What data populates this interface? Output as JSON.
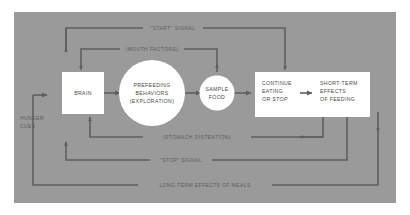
{
  "diagram": {
    "background_color": "#9a9a9a",
    "page_color": "#ffffff",
    "node_fill": "#ffffff",
    "line_color": "#5f5f5f",
    "text_color": "#4a4a4a",
    "nodes": [
      {
        "id": "brain",
        "shape": "rect",
        "lines": [
          "BRAIN"
        ]
      },
      {
        "id": "prefeeding",
        "shape": "circle",
        "lines": [
          "PREFEEDING",
          "BEHAVIORS",
          "(EXPLORATION)"
        ]
      },
      {
        "id": "sample-food",
        "shape": "circle",
        "lines": [
          "SAMPLE",
          "FOOD"
        ]
      },
      {
        "id": "continue-eating",
        "shape": "rect",
        "lines": [
          "CONTINUE",
          "EATING",
          "OR STOP"
        ],
        "italic_line": "OR STOP"
      },
      {
        "id": "short-term-effects",
        "shape": "rect",
        "lines": [
          "SHORT-TERM",
          "EFFECTS",
          "OF FEEDING"
        ]
      }
    ],
    "edge_labels": {
      "start_signal": "\"START\" SIGNAL",
      "mouth_factors": "(MOUTH FACTORS)",
      "stomach_distention": "(STOMACH DISTENTION)",
      "stop_signal": "\"STOP\" SIGNAL",
      "long_term": "LONG-TERM EFFECTS OF MEALS",
      "hunger_cues_line1": "HUNGER",
      "hunger_cues_line2": "CUES"
    }
  }
}
